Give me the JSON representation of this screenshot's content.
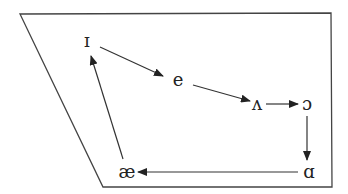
{
  "diagram": {
    "type": "vowel-shift-cycle",
    "frame": {
      "shape": "trapezoid",
      "points": [
        [
          20,
          14
        ],
        [
          331,
          13
        ],
        [
          332,
          187
        ],
        [
          103,
          187
        ]
      ]
    },
    "nodes": [
      {
        "id": "i_lax",
        "label": "ɪ",
        "x": 87,
        "y": 47
      },
      {
        "id": "e",
        "label": "e",
        "x": 178,
        "y": 86
      },
      {
        "id": "wedge",
        "label": "ʌ",
        "x": 257,
        "y": 110
      },
      {
        "id": "open_o",
        "label": "ɔ",
        "x": 307,
        "y": 110
      },
      {
        "id": "script_a",
        "label": "ɑ",
        "x": 309,
        "y": 178
      },
      {
        "id": "ae",
        "label": "æ",
        "x": 127,
        "y": 178
      }
    ],
    "edges": [
      {
        "from": "i_lax",
        "to": "e",
        "x1": 100,
        "y1": 47,
        "x2": 163,
        "y2": 76
      },
      {
        "from": "e",
        "to": "wedge",
        "x1": 193,
        "y1": 85,
        "x2": 250,
        "y2": 101
      },
      {
        "from": "wedge",
        "to": "open_o",
        "x1": 266,
        "y1": 104,
        "x2": 298,
        "y2": 104
      },
      {
        "from": "open_o",
        "to": "script_a",
        "x1": 307,
        "y1": 116,
        "x2": 307,
        "y2": 160
      },
      {
        "from": "script_a",
        "to": "ae",
        "x1": 298,
        "y1": 172,
        "x2": 138,
        "y2": 172
      },
      {
        "from": "ae",
        "to": "i_lax",
        "x1": 123,
        "y1": 159,
        "x2": 91,
        "y2": 56
      }
    ],
    "colors": {
      "line": "#333333",
      "text": "#222222",
      "background": "#ffffff"
    }
  }
}
